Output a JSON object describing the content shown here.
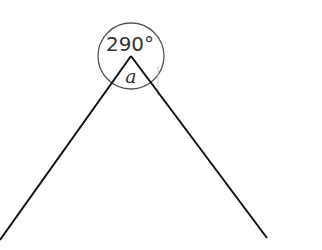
{
  "diagram": {
    "type": "angle-diagram",
    "reflex_angle_label": "290°",
    "interior_angle_label": "a",
    "colors": {
      "lines": "#111111",
      "circle": "#555555",
      "text": "#333333",
      "faint_mark": "#cccccc"
    }
  }
}
